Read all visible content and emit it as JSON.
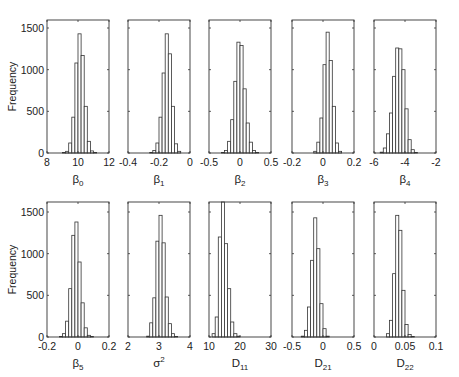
{
  "figure": {
    "ylabel": "Frequency",
    "yticks": [
      0,
      500,
      1000,
      1500
    ]
  },
  "chart_data": [
    {
      "type": "bar",
      "title": "",
      "xlabel": "β0",
      "xlabel_base": "β",
      "xlabel_sub": "0",
      "ylabel": "Frequency",
      "xlim": [
        8,
        12
      ],
      "ylim": [
        0,
        1600
      ],
      "xticks": [
        "8",
        "10",
        "12"
      ],
      "xtick_values": [
        8,
        10,
        12
      ],
      "bin_edges": [
        9.0,
        9.2,
        9.4,
        9.6,
        9.8,
        10.0,
        10.2,
        10.4,
        10.6,
        10.8,
        11.0,
        11.2
      ],
      "values": [
        5,
        20,
        120,
        430,
        1080,
        1430,
        1170,
        560,
        140,
        25,
        5
      ]
    },
    {
      "type": "bar",
      "title": "",
      "xlabel": "β1",
      "xlabel_base": "β",
      "xlabel_sub": "1",
      "ylabel": "",
      "xlim": [
        -0.4,
        0
      ],
      "ylim": [
        0,
        1600
      ],
      "xticks": [
        "-0.4",
        "-0.2",
        "0"
      ],
      "xtick_values": [
        -0.4,
        -0.2,
        0
      ],
      "bin_edges": [
        -0.26,
        -0.24,
        -0.22,
        -0.2,
        -0.18,
        -0.16,
        -0.14,
        -0.12,
        -0.1,
        -0.08,
        -0.06
      ],
      "values": [
        5,
        30,
        120,
        430,
        960,
        1430,
        1190,
        560,
        110,
        20
      ]
    },
    {
      "type": "bar",
      "title": "",
      "xlabel": "β2",
      "xlabel_base": "β",
      "xlabel_sub": "2",
      "ylabel": "",
      "xlim": [
        -0.5,
        0.5
      ],
      "ylim": [
        0,
        1600
      ],
      "xticks": [
        "-0.5",
        "0",
        "0.5"
      ],
      "xtick_values": [
        -0.5,
        0,
        0.5
      ],
      "bin_edges": [
        -0.3,
        -0.25,
        -0.2,
        -0.15,
        -0.1,
        -0.05,
        0.0,
        0.05,
        0.1,
        0.15,
        0.2,
        0.25,
        0.3,
        0.35
      ],
      "values": [
        5,
        30,
        140,
        400,
        860,
        1330,
        1290,
        770,
        360,
        130,
        30,
        5,
        0
      ]
    },
    {
      "type": "bar",
      "title": "",
      "xlabel": "β3",
      "xlabel_base": "β",
      "xlabel_sub": "3",
      "ylabel": "",
      "xlim": [
        -0.2,
        0.2
      ],
      "ylim": [
        0,
        1600
      ],
      "xticks": [
        "-0.2",
        "0",
        "0.2"
      ],
      "xtick_values": [
        -0.2,
        0,
        0.2
      ],
      "bin_edges": [
        -0.06,
        -0.04,
        -0.02,
        0.0,
        0.02,
        0.04,
        0.06,
        0.08,
        0.1,
        0.12
      ],
      "values": [
        20,
        130,
        420,
        1060,
        1450,
        1110,
        560,
        120,
        20
      ]
    },
    {
      "type": "bar",
      "title": "",
      "xlabel": "β4",
      "xlabel_base": "β",
      "xlabel_sub": "4",
      "ylabel": "",
      "xlim": [
        -6,
        -2
      ],
      "ylim": [
        0,
        1600
      ],
      "xticks": [
        "-6",
        "-4",
        "-2"
      ],
      "xtick_values": [
        -6,
        -4,
        -2
      ],
      "bin_edges": [
        -5.6,
        -5.4,
        -5.2,
        -5.0,
        -4.8,
        -4.6,
        -4.4,
        -4.2,
        -4.0,
        -3.8,
        -3.6,
        -3.4,
        -3.2
      ],
      "values": [
        10,
        60,
        230,
        480,
        920,
        1260,
        1250,
        1000,
        530,
        160,
        40,
        5
      ]
    },
    {
      "type": "bar",
      "title": "",
      "xlabel": "β5",
      "xlabel_base": "β",
      "xlabel_sub": "5",
      "ylabel": "Frequency",
      "xlim": [
        -0.2,
        0.2
      ],
      "ylim": [
        0,
        1600
      ],
      "xticks": [
        "-0.2",
        "0",
        "0.2"
      ],
      "xtick_values": [
        -0.2,
        0,
        0.2
      ],
      "bin_edges": [
        -0.12,
        -0.1,
        -0.08,
        -0.06,
        -0.04,
        -0.02,
        0.0,
        0.02,
        0.04,
        0.06,
        0.08,
        0.1
      ],
      "values": [
        5,
        40,
        190,
        580,
        1220,
        1380,
        900,
        410,
        110,
        20,
        5
      ]
    },
    {
      "type": "bar",
      "title": "",
      "xlabel": "σ2",
      "xlabel_base": "σ",
      "xlabel_sup": "2",
      "ylabel": "",
      "xlim": [
        2,
        4
      ],
      "ylim": [
        0,
        1600
      ],
      "xticks": [
        "2",
        "3",
        "4"
      ],
      "xtick_values": [
        2,
        3,
        4
      ],
      "bin_edges": [
        2.6,
        2.7,
        2.8,
        2.9,
        3.0,
        3.1,
        3.2,
        3.3,
        3.4,
        3.5,
        3.6,
        3.7
      ],
      "values": [
        10,
        170,
        470,
        1150,
        1460,
        1130,
        480,
        160,
        40,
        5,
        0
      ]
    },
    {
      "type": "bar",
      "title": "",
      "xlabel": "D11",
      "xlabel_base": "D",
      "xlabel_sub": "11",
      "ylabel": "",
      "xlim": [
        10,
        30
      ],
      "ylim": [
        0,
        1600
      ],
      "xticks": [
        "10",
        "20",
        "30"
      ],
      "xtick_values": [
        10,
        20,
        30
      ],
      "bin_edges": [
        11.0,
        12.0,
        13.0,
        14.0,
        15.0,
        16.0,
        17.0,
        18.0,
        19.0,
        20.0,
        21.0
      ],
      "values": [
        40,
        240,
        1200,
        1620,
        1120,
        580,
        180,
        40,
        10,
        0
      ]
    },
    {
      "type": "bar",
      "title": "",
      "xlabel": "D21",
      "xlabel_base": "D",
      "xlabel_sub": "21",
      "ylabel": "",
      "xlim": [
        -0.5,
        0.5
      ],
      "ylim": [
        0,
        1600
      ],
      "xticks": [
        "-0.5",
        "0",
        "0.5"
      ],
      "xtick_values": [
        -0.5,
        0,
        0.5
      ],
      "bin_edges": [
        -0.35,
        -0.3,
        -0.25,
        -0.2,
        -0.15,
        -0.1,
        -0.05,
        0.0,
        0.05,
        0.1
      ],
      "values": [
        10,
        80,
        360,
        920,
        1430,
        1060,
        400,
        100,
        10
      ]
    },
    {
      "type": "bar",
      "title": "",
      "xlabel": "D22",
      "xlabel_base": "D",
      "xlabel_sub": "22",
      "ylabel": "",
      "xlim": [
        0,
        0.1
      ],
      "ylim": [
        0,
        1600
      ],
      "xticks": [
        "0",
        "0.05",
        "0.1"
      ],
      "xtick_values": [
        0,
        0.05,
        0.1
      ],
      "bin_edges": [
        0.02,
        0.025,
        0.03,
        0.035,
        0.04,
        0.045,
        0.05,
        0.055,
        0.06,
        0.065
      ],
      "values": [
        40,
        200,
        760,
        1460,
        1280,
        560,
        150,
        30,
        5
      ]
    }
  ]
}
